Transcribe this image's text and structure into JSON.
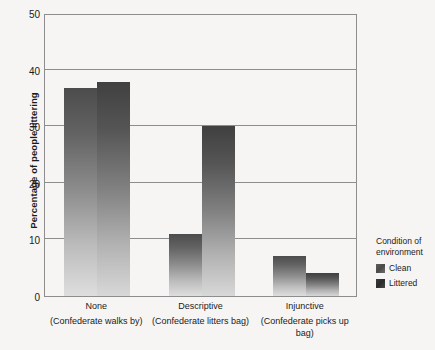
{
  "chart_data": {
    "type": "bar",
    "title": "",
    "xlabel": "",
    "ylabel": "Percentage of people littering",
    "ylim": [
      0,
      50
    ],
    "yticks": [
      0,
      10,
      20,
      30,
      40,
      50
    ],
    "grid": true,
    "legend_position": "right",
    "legend_title": "Condition of environment",
    "categories": [
      {
        "main": "None",
        "sub": "(Confederate walks by)"
      },
      {
        "main": "Descriptive",
        "sub": "(Confederate litters bag)"
      },
      {
        "main": "Injunctive",
        "sub": "(Confederate picks up bag)"
      }
    ],
    "category_labels": [
      "None",
      "Descriptive",
      "Injunctive"
    ],
    "series": [
      {
        "name": "Clean",
        "color": "#8e8e8e",
        "values": [
          36.7,
          11.0,
          7.0
        ]
      },
      {
        "name": "Littered",
        "color": "#818181",
        "values": [
          37.8,
          30.0,
          4.0
        ]
      }
    ]
  },
  "legend": {
    "title_line1": "Condition of",
    "title_line2": "environment",
    "items": [
      {
        "label": "Clean",
        "swatch": "clean"
      },
      {
        "label": "Littered",
        "swatch": "littered"
      }
    ]
  },
  "axes": {
    "y_title": "Percentage of people littering",
    "y_tick_labels": [
      "50",
      "40",
      "30",
      "20",
      "10",
      "0"
    ]
  },
  "colors": {
    "background": "#f6f5f3",
    "frame": "#8d8d8d",
    "text": "#1b1b1b",
    "bar_top": "#4a4a4a",
    "bar_bottom": "#d8d8d8"
  }
}
